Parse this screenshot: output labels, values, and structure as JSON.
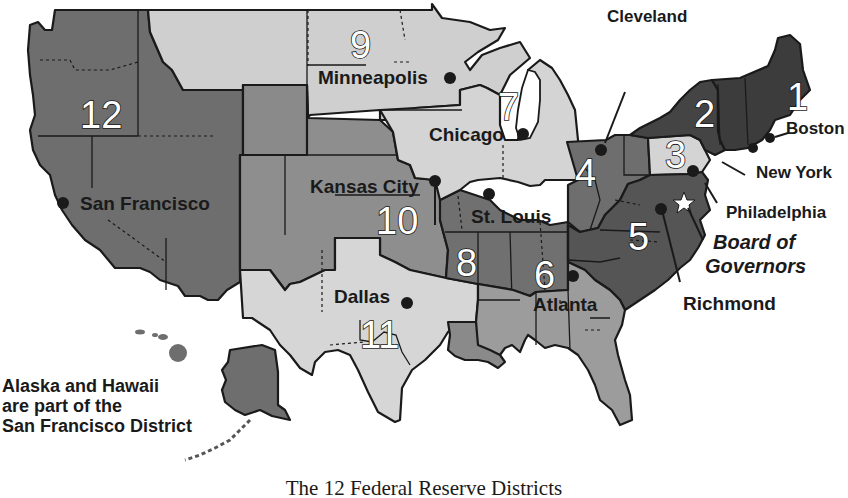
{
  "map": {
    "title": "The 12 Federal Reserve Districts",
    "colors": {
      "d1": "#3c3c3c",
      "d2": "#444444",
      "d3": "#d4d4d4",
      "d4": "#6e6e6e",
      "d5": "#555555",
      "d6": "#9c9c9c",
      "d7": "#d4d4d4",
      "d8": "#707070",
      "d9": "#cfcfcf",
      "d10": "#8e8e8e",
      "d11": "#d6d6d6",
      "d12": "#6e6e6e",
      "border": "#1a1a1a",
      "background": "#ffffff"
    },
    "districts": [
      {
        "number": "1",
        "city": "Boston"
      },
      {
        "number": "2",
        "city": "New York"
      },
      {
        "number": "3",
        "city": "Philadelphia"
      },
      {
        "number": "4",
        "city": "Cleveland"
      },
      {
        "number": "5",
        "city": "Richmond"
      },
      {
        "number": "6",
        "city": "Atlanta"
      },
      {
        "number": "7",
        "city": "Chicago"
      },
      {
        "number": "8",
        "city": "St. Louis"
      },
      {
        "number": "9",
        "city": "Minneapolis"
      },
      {
        "number": "10",
        "city": "Kansas City"
      },
      {
        "number": "11",
        "city": "Dallas"
      },
      {
        "number": "12",
        "city": "San Francisco"
      }
    ],
    "board": {
      "line1": "Board of",
      "line2": "Governors",
      "marker": "star-icon"
    },
    "note": {
      "line1": "Alaska and Hawaii",
      "line2": "are part of the",
      "line3": "San Francisco District"
    }
  }
}
